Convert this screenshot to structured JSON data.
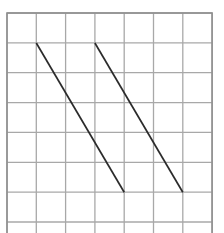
{
  "figure": {
    "title": "",
    "caption": "",
    "background_color": "#ffffff"
  },
  "chart_data": {
    "type": "line",
    "title": "",
    "subtitle": "",
    "xlabel": "",
    "ylabel": "",
    "grid": true,
    "legend_position": "none",
    "grid_spec": {
      "columns": 7,
      "rows": 8,
      "x_origin_px": 7,
      "y_origin_px": 13,
      "cell_width_px": 29.3,
      "cell_height_px": 29.86,
      "line_color": "#a8a8a8",
      "line_width_px": 1.3,
      "border_color": "#8f8f8f",
      "border_width_px": 1.6,
      "cell_fill": "#ffffff"
    },
    "xlim": [
      0,
      7
    ],
    "ylim": [
      0,
      7
    ],
    "x_tick_labels": [
      "",
      "",
      "",
      "",
      "",
      "",
      "",
      ""
    ],
    "y_tick_labels": [
      "",
      "",
      "",
      "",
      "",
      "",
      "",
      ""
    ],
    "series": [
      {
        "name": "segment-1",
        "color": "#2b2b2b",
        "width_px": 1.7,
        "grid_points": [
          [
            1,
            1
          ],
          [
            4,
            6
          ]
        ],
        "pixel_points": [
          [
            36.3,
            43.0
          ],
          [
            124.2,
            192.3
          ]
        ],
        "slope_cells": -1.6667
      },
      {
        "name": "segment-2",
        "color": "#2b2b2b",
        "width_px": 1.7,
        "grid_points": [
          [
            3,
            1
          ],
          [
            6,
            6
          ]
        ],
        "pixel_points": [
          [
            94.9,
            43.0
          ],
          [
            182.8,
            192.3
          ]
        ],
        "slope_cells": -1.6667
      }
    ],
    "annotations": []
  }
}
